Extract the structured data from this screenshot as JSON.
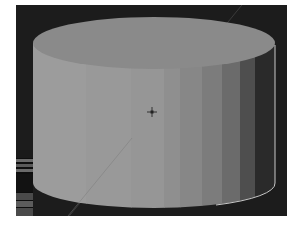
{
  "viewport": {
    "label": "3D viewport",
    "background": "#1c1c1c",
    "object": {
      "name": "cylinder",
      "selected": true,
      "top_face_color": "#8a8a8a",
      "side_band_colors": [
        "#9c9c9c",
        "#999999",
        "#969696",
        "#8f8f8f",
        "#878787",
        "#7c7c7c",
        "#6b6b6b",
        "#4e4e4e",
        "#2a2a2a"
      ],
      "outline_color": "#c8c8c8"
    },
    "cursor": {
      "name": "3d-cursor"
    }
  },
  "side_strip": {
    "bars": [
      "#1a1a1a",
      "#6a6a6a",
      "#5a5a5a",
      "#6a6a6a",
      "#121212",
      "#4a4a4a",
      "#5c5c5c",
      "#4a4a4a"
    ]
  }
}
